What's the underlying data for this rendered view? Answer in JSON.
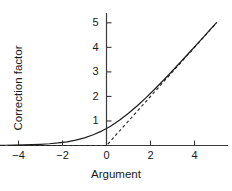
{
  "chart_data": {
    "type": "line",
    "title": "",
    "xlabel": "Argument",
    "ylabel": "Correction factor",
    "xlim": [
      -5.0,
      5.0
    ],
    "ylim": [
      0.0,
      5.4
    ],
    "grid": false,
    "legend": "none",
    "xticks": [
      -4,
      -2,
      0,
      2,
      4
    ],
    "xticklabels": [
      "−4",
      "−2",
      "0",
      "2",
      "4"
    ],
    "yticks": [
      1,
      2,
      3,
      4,
      5
    ],
    "yticklabels": [
      "1",
      "2",
      "3",
      "4",
      "5"
    ],
    "axis_color": "#3a3a3a",
    "series": [
      {
        "name": "Correction factor (smooth)",
        "style": "solid",
        "color": "#1f1f1f",
        "x": [
          -5.0,
          -4.6,
          -4.2,
          -3.8,
          -3.4,
          -3.0,
          -2.6,
          -2.2,
          -1.8,
          -1.4,
          -1.0,
          -0.6,
          -0.2,
          0.0,
          0.2,
          0.6,
          1.0,
          1.4,
          1.8,
          2.2,
          2.6,
          3.0,
          3.4,
          3.8,
          4.2,
          4.6,
          5.0
        ],
        "y": [
          0.0067,
          0.01,
          0.0149,
          0.0222,
          0.033,
          0.0486,
          0.0715,
          0.1047,
          0.1522,
          0.2184,
          0.3133,
          0.4374,
          0.5981,
          0.6931,
          0.7981,
          1.0374,
          1.3133,
          1.6184,
          1.9522,
          2.3047,
          2.6715,
          3.0486,
          3.433,
          3.8222,
          4.2149,
          4.61,
          5.0067
        ]
      },
      {
        "name": "Asymptote max(0, x)",
        "style": "dashed",
        "color": "#1f1f1f",
        "x": [
          -5.0,
          0.0,
          5.0
        ],
        "y": [
          0.0,
          0.0,
          5.0
        ]
      }
    ]
  }
}
